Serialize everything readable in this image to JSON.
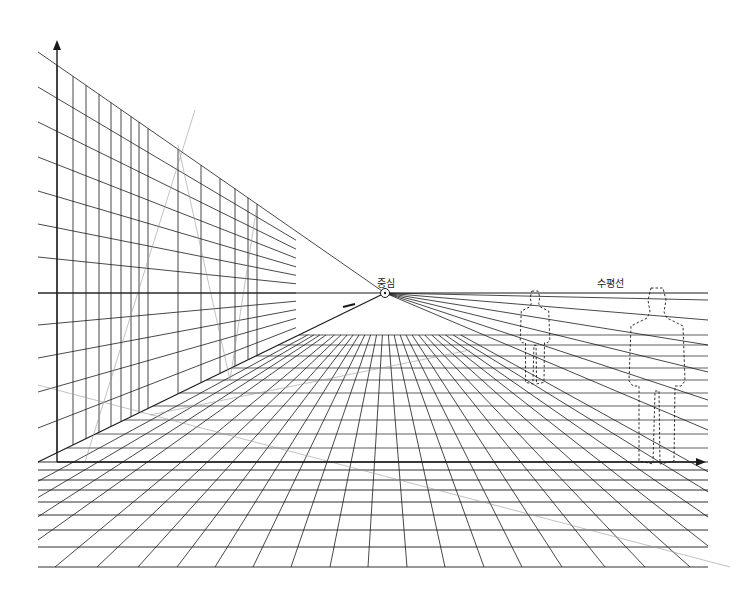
{
  "diagram": {
    "type": "one-point-perspective",
    "canvas": {
      "width": 747,
      "height": 604,
      "background": "#ffffff",
      "ink": "#1a1a1a"
    },
    "labels": {
      "center": "중심",
      "horizon": "수평선"
    },
    "label_positions": {
      "center": {
        "x": 377,
        "y": 275
      },
      "horizon": {
        "x": 597,
        "y": 275
      }
    },
    "vanishing_point": {
      "x": 385,
      "y": 293,
      "marker": "circle-dot"
    },
    "horizon_line": {
      "x1": 38,
      "x2": 708,
      "y": 293
    },
    "vertical_axis": {
      "x": 57,
      "y_top": 40,
      "y_bottom": 462,
      "arrow": "up"
    },
    "ground_axis": {
      "y": 462,
      "x_left": 57,
      "x_right": 706,
      "arrow": "right"
    },
    "wall": {
      "left_edge_x": 38,
      "end_x": 296,
      "left_edge_y_lines": [
        52,
        87,
        122,
        157,
        191,
        224,
        257,
        293,
        325,
        358,
        392,
        428,
        462
      ],
      "vertical_xs": [
        57,
        73,
        86,
        99,
        111,
        121,
        131,
        139,
        148,
        178,
        201,
        220,
        235,
        248,
        257
      ]
    },
    "floor": {
      "horizontal_ys": [
        462,
        470,
        480,
        490,
        502,
        515,
        530,
        547,
        567
      ],
      "x_left": 38,
      "x_right": 708,
      "bottom_y": 567,
      "bottom_xs": [
        -120,
        -80,
        -40,
        0,
        55,
        97,
        138,
        177,
        215,
        253,
        291,
        330,
        368,
        407,
        445,
        484,
        522,
        562,
        605,
        645,
        690,
        735,
        780,
        830,
        880
      ]
    },
    "construction_lines": [
      {
        "x1": 38,
        "y1": 385,
        "x2": 730,
        "y2": 567
      },
      {
        "x1": 195,
        "y1": 110,
        "x2": 85,
        "y2": 462
      },
      {
        "x1": 178,
        "y1": 145,
        "x2": 230,
        "y2": 380
      },
      {
        "x1": 257,
        "y1": 205,
        "x2": 230,
        "y2": 380
      },
      {
        "x1": 150,
        "y1": 415,
        "x2": 470,
        "y2": 350
      }
    ],
    "figures": [
      {
        "name": "small-figure",
        "x": 520,
        "y_top": 290,
        "y_bottom": 385,
        "width": 30
      },
      {
        "name": "large-figure",
        "x": 628,
        "y_top": 286,
        "y_bottom": 466,
        "width": 58
      }
    ]
  }
}
